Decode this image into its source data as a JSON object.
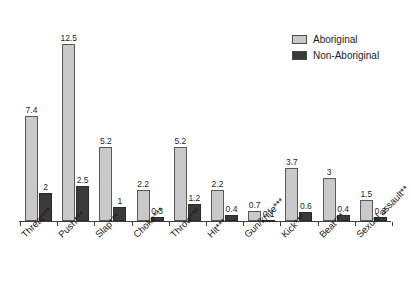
{
  "chart_data": {
    "type": "bar",
    "title": "",
    "subtitle": "",
    "xlabel": "",
    "ylabel": "",
    "ylim": [
      0,
      13.6
    ],
    "grid": false,
    "legend_position": "top-right",
    "categories": [
      "Threat***",
      "Push***",
      "Slap***",
      "Choke***",
      "Throw***",
      "Hit***",
      "Gun/knife***",
      "Kick***",
      "Beat***",
      "Sexual assault**"
    ],
    "series": [
      {
        "name": "Aboriginal",
        "color": "#c9c9c9",
        "values": [
          7.4,
          12.5,
          5.2,
          2.2,
          5.2,
          2.2,
          0.7,
          3.7,
          3,
          1.5
        ],
        "value_labels": [
          "7.4",
          "12.5",
          "5.2",
          "2.2",
          "5.2",
          "2.2",
          "0.7",
          "3.7",
          "3",
          "1.5"
        ]
      },
      {
        "name": "Non-Aboriginal",
        "color": "#3a3a3a",
        "values": [
          2,
          2.5,
          1,
          0.3,
          1.2,
          0.4,
          0.1,
          0.6,
          0.4,
          0.3
        ],
        "value_labels": [
          "2",
          "2.5",
          "1",
          "0.3",
          "1.2",
          "0.4",
          "0.1",
          "0.6",
          "0.4",
          "0.3"
        ]
      }
    ]
  },
  "legend": {
    "items": [
      {
        "label": "Aboriginal",
        "color": "#c9c9c9"
      },
      {
        "label": "Non-Aboriginal",
        "color": "#3a3a3a"
      }
    ]
  }
}
